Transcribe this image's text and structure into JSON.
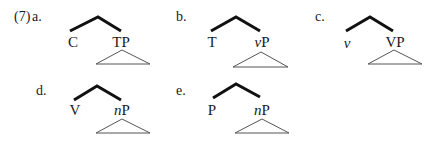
{
  "example": {
    "number": "(7)",
    "items": [
      {
        "label": "a.",
        "head": "C",
        "head_italic": false,
        "complement_prefix": "",
        "complement_prefix_italic": false,
        "complement": "TP"
      },
      {
        "label": "b.",
        "head": "T",
        "head_italic": false,
        "complement_prefix": "v",
        "complement_prefix_italic": true,
        "complement": "P"
      },
      {
        "label": "c.",
        "head": "v",
        "head_italic": true,
        "complement_prefix": "",
        "complement_prefix_italic": false,
        "complement": "VP"
      },
      {
        "label": "d.",
        "head": "V",
        "head_italic": false,
        "complement_prefix": "n",
        "complement_prefix_italic": true,
        "complement": "P"
      },
      {
        "label": "e.",
        "head": "P",
        "head_italic": false,
        "complement_prefix": "n",
        "complement_prefix_italic": true,
        "complement": "P"
      }
    ]
  },
  "colors": {
    "branch": "#111111",
    "triangle": "#555555",
    "text": "#1a1a1a"
  }
}
